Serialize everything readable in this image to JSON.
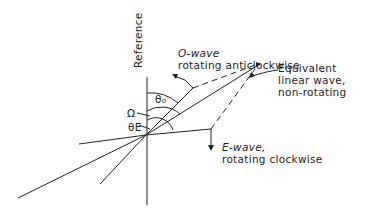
{
  "diagram": {
    "reference_label": "Reference",
    "o_wave": {
      "line1": "O-wave",
      "line2": "rotating anticlockwise"
    },
    "linear_wave": {
      "line1": "Equivalent",
      "line2": "linear wave,",
      "line3": "non-rotating"
    },
    "e_wave": {
      "line1": "E-wave,",
      "line2": "rotating clockwise"
    },
    "angles": {
      "theta_o": "θ₀",
      "omega": "Ω",
      "theta_e": "θE"
    },
    "colors": {
      "ink": "#222222",
      "background": "#ffffff"
    }
  }
}
